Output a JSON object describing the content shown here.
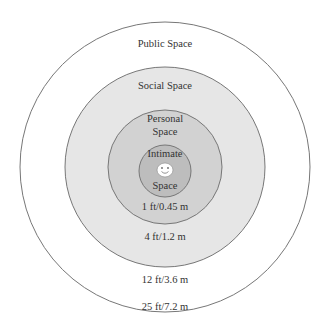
{
  "diagram": {
    "type": "concentric-circles",
    "zones": [
      {
        "name": "Public Space",
        "distance": "25 ft/7.2 m",
        "fill": "#ffffff"
      },
      {
        "name": "Social Space",
        "distance": "12 ft/3.6 m",
        "fill": "#e6e6e6"
      },
      {
        "name": "Personal Space",
        "name_line1": "Personal",
        "name_line2": "Space",
        "distance": "4 ft/1.2 m",
        "fill": "#d2d2d2"
      },
      {
        "name": "Intimate Space",
        "name_line1": "Intimate",
        "name_line2": "Space",
        "distance": "1 ft/0.45 m",
        "fill": "#bdbdbd"
      }
    ],
    "center_icon": "smiley-face-icon",
    "stroke_color": "#777777"
  }
}
